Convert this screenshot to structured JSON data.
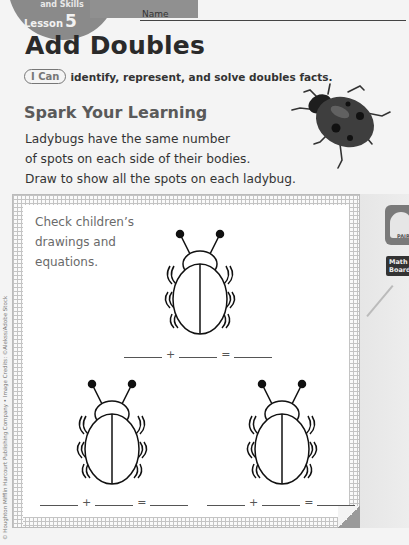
{
  "header": {
    "badge_subtitle": "and Skills",
    "lesson_label": "Lesson",
    "lesson_number": "5",
    "name_label": "Name"
  },
  "lesson": {
    "title": "Add Doubles",
    "i_can_pill": "I Can",
    "i_can_text": "identify, represent, and solve doubles facts.",
    "section_heading": "Spark Your Learning",
    "prompt_lines": [
      "Ladybugs have the same number",
      "of spots on each side of their bodies.",
      "Draw to show all the spots on each ladybug."
    ]
  },
  "activity": {
    "teacher_note_lines": [
      "Check children’s",
      "drawings and",
      "equations."
    ],
    "equations": [
      {
        "plus": "+",
        "equals": "="
      },
      {
        "plus": "+",
        "equals": "="
      },
      {
        "plus": "+",
        "equals": "="
      }
    ]
  },
  "sidebar": {
    "pairs_label": "PAIRS",
    "mathboard_label_line1": "Math",
    "mathboard_label_line2": "Board"
  },
  "footer": {
    "credit": "© Houghton Mifflin Harcourt Publishing Company • Image Credits: ©Alekss/Adobe Stock"
  },
  "colors": {
    "ladybug_body": "#3a3a3a",
    "grid_line": "#c4c4c4"
  }
}
